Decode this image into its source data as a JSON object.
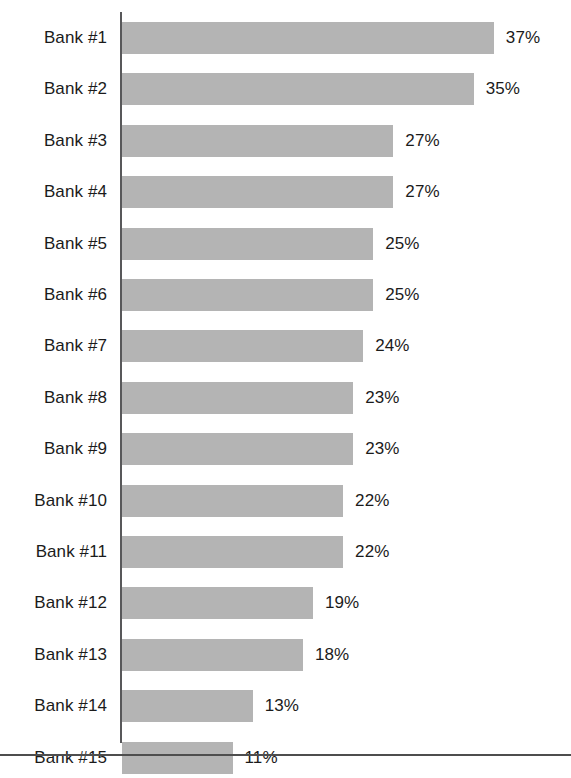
{
  "chart_data": {
    "type": "bar",
    "orientation": "horizontal",
    "title": "",
    "subtitle": "",
    "xlabel": "",
    "ylabel": "",
    "categories": [
      "Bank #1",
      "Bank #2",
      "Bank #3",
      "Bank #4",
      "Bank #5",
      "Bank #6",
      "Bank #7",
      "Bank #8",
      "Bank #9",
      "Bank #10",
      "Bank #11",
      "Bank #12",
      "Bank #13",
      "Bank #14",
      "Bank #15"
    ],
    "values": [
      37,
      35,
      27,
      27,
      25,
      25,
      24,
      23,
      23,
      22,
      22,
      19,
      18,
      13,
      11
    ],
    "value_labels": [
      "37%",
      "35%",
      "27%",
      "27%",
      "25%",
      "25%",
      "24%",
      "23%",
      "23%",
      "22%",
      "22%",
      "19%",
      "18%",
      "13%",
      "11%"
    ],
    "units": "%",
    "xlim": [
      0,
      37
    ],
    "grid": false,
    "legend": null,
    "series": [
      {
        "name": "Percent",
        "values": [
          37,
          35,
          27,
          27,
          25,
          25,
          24,
          23,
          23,
          22,
          22,
          19,
          18,
          13,
          11
        ]
      }
    ],
    "bar_color": "#b4b4b4",
    "axis_color": "#58585a",
    "text_color": "#1b1b1b",
    "tick_labels": [],
    "annotations": []
  }
}
